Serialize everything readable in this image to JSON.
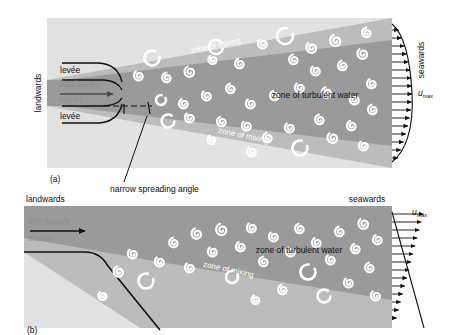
{
  "figure": {
    "panels": [
      {
        "tag": "(a)",
        "type": "two-levee-confined-jet",
        "landwards_label": "landwards",
        "seawards_label": "seawards",
        "distributary_label_line1": "distributary",
        "distributary_label_line2": "mouth",
        "levee_top_label": "levée",
        "levee_bottom_label": "levée",
        "zone_mixing_top_label": "zone of mixing",
        "zone_mixing_bottom_label": "zone of mixing",
        "zone_turbulent_label": "zone of turbulent water",
        "umax_symbol": "u",
        "umax_subscript": "max",
        "annotation": "narrow spreading angle",
        "velocity_profile": "bell-shaped-symmetric"
      },
      {
        "tag": "(b)",
        "type": "single-levee-unconfined-jet",
        "landwards_label": "landwards",
        "seawards_label": "seawards",
        "distributary_label_line1": "distributary",
        "distributary_label_line2": "mouth",
        "zone_mixing_label": "zone of mixing",
        "zone_turbulent_label": "zone of turbulent water",
        "umax_symbol": "u",
        "umax_subscript": "max",
        "velocity_profile": "linear-ramp-asymmetric"
      }
    ]
  },
  "colors": {
    "page_background": "#ffffff",
    "panel_background": "#e2e2e2",
    "mixing_zone": "#bcbcbc",
    "turbulent_zone": "#9a9a9a",
    "eddy_white": "#ffffff",
    "line_black": "#111111",
    "label_gray": "#8e8e8e"
  },
  "eddies": {
    "panel_a": [
      {
        "x": 152,
        "y": 58,
        "r": 7.5,
        "style": "ring",
        "rot": 20
      },
      {
        "x": 139,
        "y": 76,
        "r": 5.5,
        "style": "spiral",
        "rot": 0
      },
      {
        "x": 167,
        "y": 78,
        "r": 5.5,
        "style": "spiral",
        "rot": 30
      },
      {
        "x": 190,
        "y": 72,
        "r": 6.0,
        "style": "spiral",
        "rot": 10
      },
      {
        "x": 213,
        "y": 60,
        "r": 5.0,
        "style": "spiral",
        "rot": 0
      },
      {
        "x": 216,
        "y": 47,
        "r": 7.0,
        "style": "ring",
        "rot": 40
      },
      {
        "x": 240,
        "y": 64,
        "r": 5.5,
        "style": "spiral",
        "rot": 15
      },
      {
        "x": 263,
        "y": 44,
        "r": 5.5,
        "style": "spiral",
        "rot": 0
      },
      {
        "x": 285,
        "y": 36,
        "r": 8.0,
        "style": "ring",
        "rot": 10
      },
      {
        "x": 294,
        "y": 60,
        "r": 5.5,
        "style": "spiral",
        "rot": 25
      },
      {
        "x": 312,
        "y": 48,
        "r": 6.0,
        "style": "spiral",
        "rot": 0
      },
      {
        "x": 336,
        "y": 41,
        "r": 6.5,
        "style": "spiral",
        "rot": 15
      },
      {
        "x": 316,
        "y": 71,
        "r": 5.5,
        "style": "spiral",
        "rot": 0
      },
      {
        "x": 343,
        "y": 66,
        "r": 5.5,
        "style": "spiral",
        "rot": 20
      },
      {
        "x": 363,
        "y": 54,
        "r": 6.0,
        "style": "spiral",
        "rot": 0
      },
      {
        "x": 367,
        "y": 33,
        "r": 5.5,
        "style": "spiral",
        "rot": 30
      },
      {
        "x": 161,
        "y": 100,
        "r": 5.0,
        "style": "ring",
        "rot": 0
      },
      {
        "x": 184,
        "y": 104,
        "r": 5.5,
        "style": "spiral",
        "rot": 10
      },
      {
        "x": 207,
        "y": 96,
        "r": 5.5,
        "style": "spiral",
        "rot": 0
      },
      {
        "x": 231,
        "y": 89,
        "r": 5.5,
        "style": "spiral",
        "rot": 25
      },
      {
        "x": 251,
        "y": 104,
        "r": 5.5,
        "style": "spiral",
        "rot": 0
      },
      {
        "x": 275,
        "y": 96,
        "r": 5.5,
        "style": "spiral",
        "rot": 15
      },
      {
        "x": 300,
        "y": 88,
        "r": 5.5,
        "style": "spiral",
        "rot": 0
      },
      {
        "x": 327,
        "y": 93,
        "r": 6.0,
        "style": "spiral",
        "rot": 20
      },
      {
        "x": 355,
        "y": 100,
        "r": 5.5,
        "style": "spiral",
        "rot": 0
      },
      {
        "x": 372,
        "y": 84,
        "r": 5.5,
        "style": "spiral",
        "rot": 10
      },
      {
        "x": 168,
        "y": 121,
        "r": 6.5,
        "style": "ring",
        "rot": 30
      },
      {
        "x": 190,
        "y": 118,
        "r": 5.5,
        "style": "spiral",
        "rot": 0
      },
      {
        "x": 222,
        "y": 122,
        "r": 5.5,
        "style": "spiral",
        "rot": 15
      },
      {
        "x": 247,
        "y": 126,
        "r": 5.5,
        "style": "spiral",
        "rot": 0
      },
      {
        "x": 268,
        "y": 138,
        "r": 5.5,
        "style": "spiral",
        "rot": 20
      },
      {
        "x": 290,
        "y": 128,
        "r": 5.5,
        "style": "spiral",
        "rot": 0
      },
      {
        "x": 300,
        "y": 148,
        "r": 7.5,
        "style": "ring",
        "rot": 10
      },
      {
        "x": 320,
        "y": 120,
        "r": 5.5,
        "style": "spiral",
        "rot": 25
      },
      {
        "x": 333,
        "y": 138,
        "r": 6.0,
        "style": "spiral",
        "rot": 0
      },
      {
        "x": 352,
        "y": 126,
        "r": 5.5,
        "style": "spiral",
        "rot": 15
      },
      {
        "x": 364,
        "y": 146,
        "r": 5.5,
        "style": "spiral",
        "rot": 0
      },
      {
        "x": 373,
        "y": 110,
        "r": 5.5,
        "style": "spiral",
        "rot": 20
      },
      {
        "x": 252,
        "y": 152,
        "r": 5.5,
        "style": "spiral",
        "rot": 0
      },
      {
        "x": 212,
        "y": 140,
        "r": 5.0,
        "style": "spiral",
        "rot": 10
      }
    ],
    "panel_b": [
      {
        "x": 133,
        "y": 254,
        "r": 5.5,
        "style": "spiral",
        "rot": 0
      },
      {
        "x": 119,
        "y": 272,
        "r": 6.0,
        "style": "spiral",
        "rot": 20
      },
      {
        "x": 146,
        "y": 281,
        "r": 7.5,
        "style": "ring",
        "rot": 10
      },
      {
        "x": 160,
        "y": 262,
        "r": 5.5,
        "style": "spiral",
        "rot": 0
      },
      {
        "x": 174,
        "y": 243,
        "r": 5.5,
        "style": "spiral",
        "rot": 25
      },
      {
        "x": 190,
        "y": 268,
        "r": 5.5,
        "style": "spiral",
        "rot": 0
      },
      {
        "x": 197,
        "y": 234,
        "r": 6.0,
        "style": "spiral",
        "rot": 15
      },
      {
        "x": 213,
        "y": 252,
        "r": 5.5,
        "style": "spiral",
        "rot": 0
      },
      {
        "x": 222,
        "y": 230,
        "r": 6.5,
        "style": "spiral",
        "rot": 20
      },
      {
        "x": 232,
        "y": 277,
        "r": 6.0,
        "style": "ring",
        "rot": 0
      },
      {
        "x": 241,
        "y": 247,
        "r": 5.5,
        "style": "spiral",
        "rot": 10
      },
      {
        "x": 252,
        "y": 228,
        "r": 5.5,
        "style": "spiral",
        "rot": 0
      },
      {
        "x": 264,
        "y": 262,
        "r": 5.5,
        "style": "spiral",
        "rot": 25
      },
      {
        "x": 274,
        "y": 237,
        "r": 5.5,
        "style": "spiral",
        "rot": 0
      },
      {
        "x": 283,
        "y": 290,
        "r": 5.5,
        "style": "spiral",
        "rot": 15
      },
      {
        "x": 291,
        "y": 252,
        "r": 5.5,
        "style": "spiral",
        "rot": 0
      },
      {
        "x": 300,
        "y": 229,
        "r": 5.5,
        "style": "spiral",
        "rot": 20
      },
      {
        "x": 308,
        "y": 272,
        "r": 7.5,
        "style": "ring",
        "rot": 0
      },
      {
        "x": 317,
        "y": 243,
        "r": 5.5,
        "style": "spiral",
        "rot": 10
      },
      {
        "x": 324,
        "y": 296,
        "r": 6.5,
        "style": "ring",
        "rot": 30
      },
      {
        "x": 331,
        "y": 260,
        "r": 5.5,
        "style": "spiral",
        "rot": 0
      },
      {
        "x": 340,
        "y": 232,
        "r": 5.5,
        "style": "spiral",
        "rot": 20
      },
      {
        "x": 349,
        "y": 283,
        "r": 5.5,
        "style": "spiral",
        "rot": 0
      },
      {
        "x": 356,
        "y": 249,
        "r": 5.5,
        "style": "spiral",
        "rot": 15
      },
      {
        "x": 364,
        "y": 224,
        "r": 6.0,
        "style": "spiral",
        "rot": 0
      },
      {
        "x": 370,
        "y": 268,
        "r": 5.5,
        "style": "spiral",
        "rot": 25
      },
      {
        "x": 376,
        "y": 296,
        "r": 5.5,
        "style": "spiral",
        "rot": 0
      },
      {
        "x": 378,
        "y": 240,
        "r": 5.5,
        "style": "spiral",
        "rot": 10
      },
      {
        "x": 103,
        "y": 296,
        "r": 5.0,
        "style": "spiral",
        "rot": 0
      },
      {
        "x": 256,
        "y": 300,
        "r": 5.0,
        "style": "spiral",
        "rot": 15
      }
    ]
  }
}
